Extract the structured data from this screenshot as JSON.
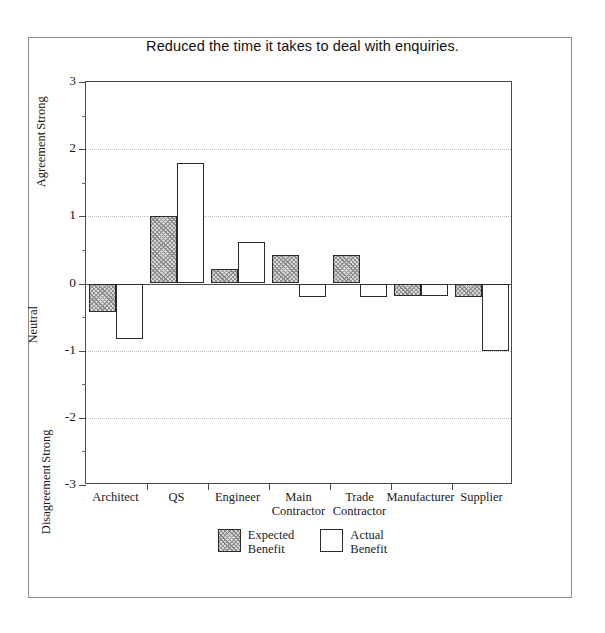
{
  "chart_data": {
    "type": "bar",
    "title": "Reduced the time it takes to deal with enquiries.",
    "xlabel": "",
    "ylabel": "",
    "ylim": [
      -3,
      3
    ],
    "ytick_values": [
      3,
      2,
      1,
      0,
      -1,
      -2,
      -3
    ],
    "ytick_labels": [
      "3",
      "2",
      "1",
      "0",
      "-1",
      "-2",
      "-3"
    ],
    "minor_ticks": [
      2.5,
      1.5,
      0.5,
      -0.5,
      -1.5,
      -2.5
    ],
    "gridlines_at": [
      2,
      1,
      -1,
      -2
    ],
    "grid": "horizontal-dotted",
    "zero_line": true,
    "axis_captions": {
      "top": {
        "line1": "Strong",
        "line2": "Agreement"
      },
      "middle": "Neutral",
      "bottom": {
        "line1": "Strong",
        "line2": "Disagreement"
      }
    },
    "categories": [
      {
        "line1": "Architect",
        "line2": ""
      },
      {
        "line1": "QS",
        "line2": ""
      },
      {
        "line1": "Engineer",
        "line2": ""
      },
      {
        "line1": "Main",
        "line2": "Contractor"
      },
      {
        "line1": "Trade",
        "line2": "Contractor"
      },
      {
        "line1": "Manufacturer",
        "line2": ""
      },
      {
        "line1": "Supplier",
        "line2": ""
      }
    ],
    "series": [
      {
        "name": "Expected Benefit",
        "legend_line1": "Expected",
        "legend_line2": "Benefit",
        "fill": "hatched",
        "color": "#d6d6d6",
        "values": [
          -0.43,
          1.0,
          0.21,
          0.42,
          0.42,
          -0.18,
          -0.2
        ]
      },
      {
        "name": "Actual Benefit",
        "legend_line1": "Actual",
        "legend_line2": "Benefit",
        "fill": "white",
        "color": "#ffffff",
        "values": [
          -0.82,
          1.8,
          0.62,
          -0.2,
          -0.2,
          -0.18,
          -1.0
        ]
      }
    ],
    "legend_position": "bottom-center"
  }
}
